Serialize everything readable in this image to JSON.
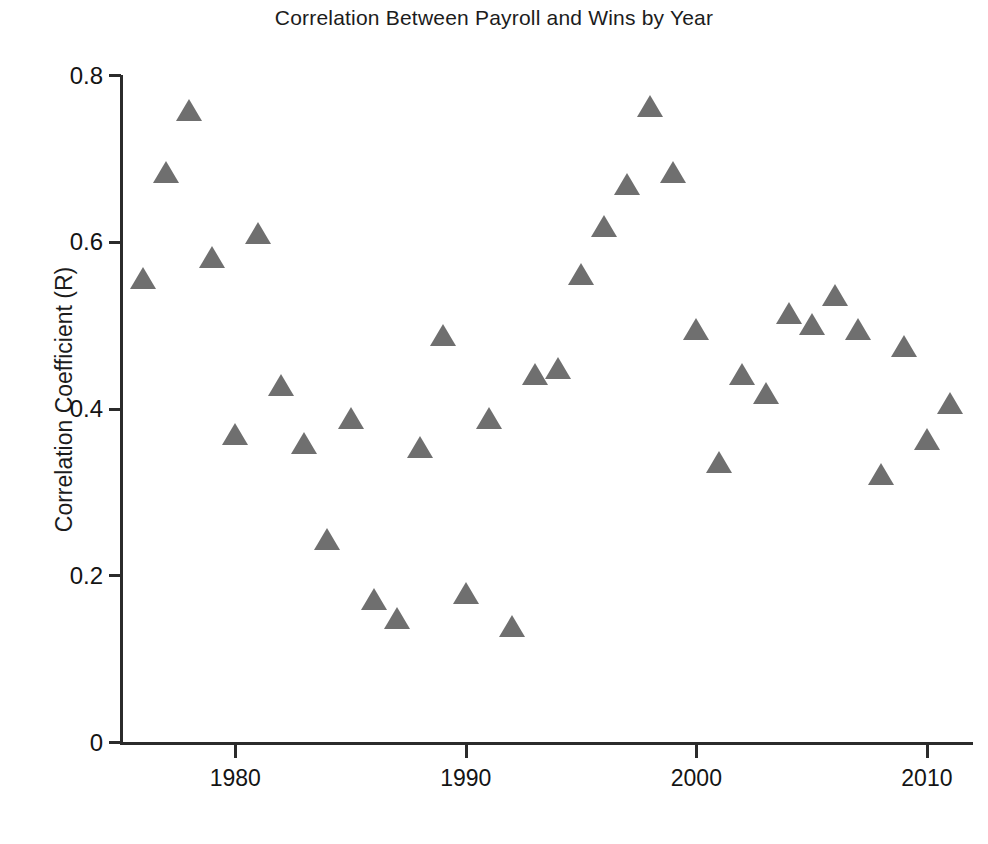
{
  "chart_data": {
    "type": "scatter",
    "title": "Correlation Between Payroll and Wins by Year",
    "xlabel": "",
    "ylabel": "Correlation Coefficient (R)",
    "xlim": [
      1975,
      2012
    ],
    "ylim": [
      0,
      0.8
    ],
    "xticks": [
      "1980",
      "1990",
      "2000",
      "2010"
    ],
    "xtick_values": [
      1980,
      1990,
      2000,
      2010
    ],
    "yticks": [
      "0",
      "0.2",
      "0.4",
      "0.6",
      "0.8"
    ],
    "ytick_values": [
      0,
      0.2,
      0.4,
      0.6,
      0.8
    ],
    "grid": false,
    "legend": null,
    "marker": "triangle",
    "marker_color": "#6f6f6f",
    "axis_color": "#2b2b2b",
    "series": [
      {
        "name": "Correlation Coefficient (R)",
        "x": [
          1976,
          1977,
          1978,
          1979,
          1980,
          1981,
          1982,
          1983,
          1984,
          1985,
          1986,
          1987,
          1988,
          1989,
          1990,
          1991,
          1992,
          1993,
          1994,
          1995,
          1996,
          1997,
          1998,
          1999,
          2000,
          2001,
          2002,
          2003,
          2004,
          2005,
          2006,
          2007,
          2008,
          2009,
          2010,
          2011
        ],
        "values": [
          0.555,
          0.683,
          0.757,
          0.58,
          0.368,
          0.609,
          0.427,
          0.357,
          0.242,
          0.387,
          0.17,
          0.148,
          0.353,
          0.487,
          0.178,
          0.388,
          0.138,
          0.44,
          0.447,
          0.56,
          0.618,
          0.668,
          0.762,
          0.682,
          0.494,
          0.335,
          0.44,
          0.417,
          0.513,
          0.5,
          0.535,
          0.494,
          0.32,
          0.474,
          0.362,
          0.405
        ]
      }
    ]
  }
}
